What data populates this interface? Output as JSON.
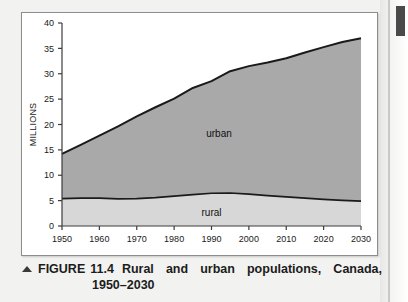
{
  "figure": {
    "marker": "▲",
    "label": "FIGURE",
    "number": "11.4",
    "title_words": [
      "Rural",
      "and",
      "urban",
      "populations,",
      "Canada,"
    ],
    "title_line2": "1950–2030",
    "full_title": "Rural and urban populations, Canada, 1950–2030"
  },
  "colors": {
    "urban_fill": "#a9a9a9",
    "rural_fill": "#d7d7d7",
    "line": "#1a1a1a",
    "axis": "#3c3c3c",
    "card_bg": "#ffffff",
    "page_bg": "#f2f2f0"
  },
  "chart_data": {
    "type": "area",
    "xlabel": "",
    "ylabel": "MILLIONS",
    "xlim": [
      1950,
      2030
    ],
    "ylim": [
      0,
      40
    ],
    "grid": false,
    "stacked": true,
    "legend": "inline-annotation",
    "xticks": [
      1950,
      1960,
      1970,
      1980,
      1990,
      2000,
      2010,
      2020,
      2030
    ],
    "xtick_labels": [
      "1950",
      "1960",
      "1970",
      "1980",
      "1990",
      "2000",
      "2010",
      "2020",
      "2030"
    ],
    "yticks": [
      0,
      5,
      10,
      15,
      20,
      25,
      30,
      35,
      40
    ],
    "ytick_labels": [
      "0",
      "5",
      "10",
      "15",
      "20",
      "25",
      "30",
      "35",
      "40"
    ],
    "x": [
      1950,
      1955,
      1960,
      1965,
      1970,
      1975,
      1980,
      1985,
      1990,
      1995,
      2000,
      2005,
      2010,
      2015,
      2020,
      2025,
      2030
    ],
    "series": [
      {
        "name": "rural",
        "label": "rural",
        "label_x": 1990,
        "label_y": 2.0,
        "fill": "#d7d7d7",
        "values": [
          5.4,
          5.5,
          5.5,
          5.35,
          5.4,
          5.6,
          5.9,
          6.2,
          6.45,
          6.5,
          6.3,
          6.0,
          5.75,
          5.5,
          5.25,
          5.05,
          4.9
        ]
      },
      {
        "name": "urban",
        "label": "urban",
        "label_x": 1992,
        "label_y": 17.5,
        "fill": "#a9a9a9",
        "values": [
          8.8,
          10.5,
          12.3,
          14.3,
          16.2,
          17.8,
          19.2,
          21.0,
          22.1,
          24.0,
          25.2,
          26.2,
          27.3,
          28.7,
          30.0,
          31.2,
          32.1
        ]
      }
    ],
    "total_line": {
      "name": "total population",
      "values": [
        14.2,
        16.0,
        17.8,
        19.65,
        21.6,
        23.4,
        25.1,
        27.2,
        28.55,
        30.5,
        31.5,
        32.2,
        33.05,
        34.2,
        35.25,
        36.25,
        37.0
      ]
    },
    "annotations": [
      {
        "text": "urban",
        "x": 1992,
        "y": 17.5
      },
      {
        "text": "rural",
        "x": 1990,
        "y": 2.0
      }
    ]
  }
}
